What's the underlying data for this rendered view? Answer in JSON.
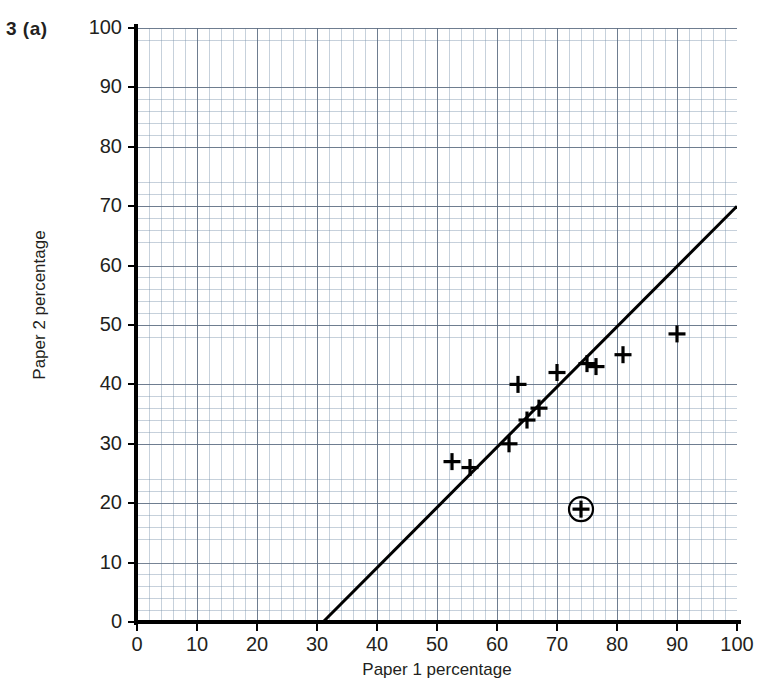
{
  "question_label": "3 (a)",
  "chart_data": {
    "type": "scatter",
    "title": "",
    "xlabel": "Paper 1 percentage",
    "ylabel": "Paper 2 percentage",
    "xlim": [
      0,
      100
    ],
    "ylim": [
      0,
      100
    ],
    "xticks": [
      0,
      10,
      20,
      30,
      40,
      50,
      60,
      70,
      80,
      90,
      100
    ],
    "yticks": [
      0,
      10,
      20,
      30,
      40,
      50,
      60,
      70,
      80,
      90,
      100
    ],
    "grid": true,
    "grid_minor_step": 2,
    "grid_major_step": 10,
    "legend": "none",
    "marker": "plus-cross",
    "marker_color": "#000000",
    "points": [
      {
        "x": 52.5,
        "y": 27,
        "marker": "cross"
      },
      {
        "x": 55.5,
        "y": 26,
        "marker": "cross"
      },
      {
        "x": 62,
        "y": 30,
        "marker": "cross"
      },
      {
        "x": 63.5,
        "y": 40,
        "marker": "cross"
      },
      {
        "x": 65,
        "y": 34,
        "marker": "cross"
      },
      {
        "x": 67,
        "y": 36,
        "marker": "cross"
      },
      {
        "x": 70,
        "y": 42,
        "marker": "cross"
      },
      {
        "x": 74,
        "y": 19,
        "marker": "cross-circled"
      },
      {
        "x": 75,
        "y": 43.5,
        "marker": "cross"
      },
      {
        "x": 76.5,
        "y": 43,
        "marker": "cross"
      },
      {
        "x": 81,
        "y": 45,
        "marker": "cross"
      },
      {
        "x": 90,
        "y": 48.5,
        "marker": "cross"
      }
    ],
    "trend_line": {
      "label": "line of best fit",
      "start": {
        "x": 31,
        "y": 0
      },
      "end": {
        "x": 100,
        "y": 70
      },
      "color": "#000000"
    },
    "annotations": [
      {
        "type": "circle",
        "x": 74,
        "y": 19,
        "note": "circled outlier point"
      }
    ]
  },
  "axis": {
    "x_title": "Paper 1 percentage",
    "y_title": "Paper 2 percentage",
    "x_labels": [
      "0",
      "10",
      "20",
      "30",
      "40",
      "50",
      "60",
      "70",
      "80",
      "90",
      "100"
    ],
    "y_labels": [
      "0",
      "10",
      "20",
      "30",
      "40",
      "50",
      "60",
      "70",
      "80",
      "90",
      "100"
    ]
  }
}
